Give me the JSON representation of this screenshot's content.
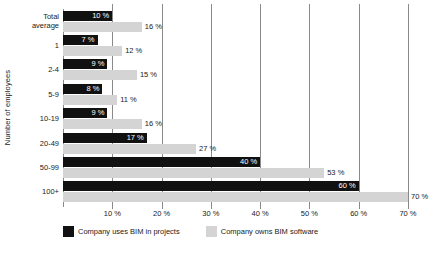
{
  "chart_data": {
    "type": "bar",
    "orientation": "horizontal",
    "title": "",
    "xlabel": "",
    "ylabel": "Number of employees",
    "xlim": [
      0,
      70
    ],
    "xticks": [
      10,
      20,
      30,
      40,
      50,
      60,
      70
    ],
    "xtick_labels": [
      "10 %",
      "20 %",
      "30 %",
      "40 %",
      "50 %",
      "60 %",
      "70 %"
    ],
    "grid": true,
    "grid_axis": "x",
    "legend_position": "bottom-left",
    "value_suffix": " %",
    "categories": [
      "Total average",
      "1",
      "2-4",
      "5-9",
      "10-19",
      "20-49",
      "50-99",
      "100+"
    ],
    "category_lines": [
      [
        "Total",
        "average"
      ],
      [
        "1"
      ],
      [
        "2-4"
      ],
      [
        "5-9"
      ],
      [
        "10-19"
      ],
      [
        "20-49"
      ],
      [
        "50-99"
      ],
      [
        "100+"
      ]
    ],
    "series": [
      {
        "name": "Company uses BIM in projects",
        "color": "#111111",
        "label_color": "#ffffff",
        "label_position": "inside",
        "values": [
          10,
          7,
          9,
          8,
          9,
          17,
          40,
          60
        ],
        "labels": [
          "10 %",
          "7 %",
          "9 %",
          "8 %",
          "9 %",
          "17 %",
          "40 %",
          "60 %"
        ]
      },
      {
        "name": "Company owns BIM software",
        "color": "#d4d4d4",
        "label_color": "#1a1a1a",
        "label_position": "outside",
        "values": [
          16,
          12,
          15,
          11,
          16,
          27,
          53,
          70
        ],
        "labels": [
          "16 %",
          "12 %",
          "15 %",
          "11 %",
          "16 %",
          "27 %",
          "53 %",
          "70 %"
        ]
      }
    ]
  },
  "legend": {
    "items": [
      {
        "label": "Company uses BIM in projects",
        "color": "#111111"
      },
      {
        "label": "Company owns BIM software",
        "color": "#d4d4d4"
      }
    ]
  },
  "axes": {
    "y_title": "Number of employees",
    "axis_color": "#8a8a8a"
  }
}
